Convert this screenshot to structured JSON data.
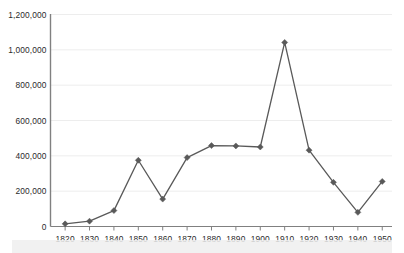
{
  "chart_data": {
    "type": "line",
    "title": "",
    "subtitle": "",
    "xlabel": "",
    "ylabel": "",
    "x": [
      1820,
      1830,
      1840,
      1850,
      1860,
      1870,
      1880,
      1890,
      1900,
      1910,
      1920,
      1930,
      1940,
      1950
    ],
    "xtick_labels": [
      "1820",
      "1830",
      "1840",
      "1850",
      "1860",
      "1870",
      "1880",
      "1890",
      "1900",
      "1910",
      "1920",
      "1930",
      "1940",
      "1950"
    ],
    "ytick_labels": [
      "0",
      "200,000",
      "400,000",
      "600,000",
      "800,000",
      "1,000,000",
      "1,200,000"
    ],
    "ytick_values": [
      0,
      200000,
      400000,
      600000,
      800000,
      1000000,
      1200000
    ],
    "series": [
      {
        "name": "",
        "values": [
          15000,
          30000,
          90000,
          375000,
          155000,
          390000,
          458000,
          456000,
          450000,
          1042000,
          432000,
          250000,
          80000,
          255000
        ],
        "color": "#595959",
        "marker": "diamond",
        "marker_size": 3
      }
    ],
    "xlim": [
      1814,
      1954
    ],
    "ylim": [
      0,
      1200000
    ],
    "grid": true,
    "grid_axis": "y",
    "grid_color": "#ededed",
    "axis_color": "#808080",
    "legend": false,
    "legend_position": "none"
  },
  "caption": {
    "watermark_text": ""
  }
}
